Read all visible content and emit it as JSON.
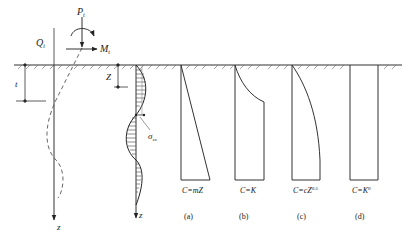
{
  "figure": {
    "load_labels": {
      "axial_load": "P",
      "axial_load_sub": "t",
      "shear_load": "Q",
      "shear_load_sub": "t",
      "moment": "M",
      "moment_sub": "t"
    },
    "dimension_labels": {
      "embedment": "t",
      "depth": "Z",
      "stress": "σ",
      "stress_sub": "zx",
      "axis_left": "z",
      "axis_mid": "z"
    },
    "panels": [
      {
        "id": "a",
        "formula": "C=mZ",
        "caption": "(a)"
      },
      {
        "id": "b",
        "formula": "C=K",
        "caption": "(b)"
      },
      {
        "id": "c",
        "formula": "C=cZ",
        "formula_sup": "0.5",
        "caption": "(c)"
      },
      {
        "id": "d",
        "formula": "C=K",
        "formula_sup": "0",
        "caption": "(d)"
      }
    ]
  }
}
